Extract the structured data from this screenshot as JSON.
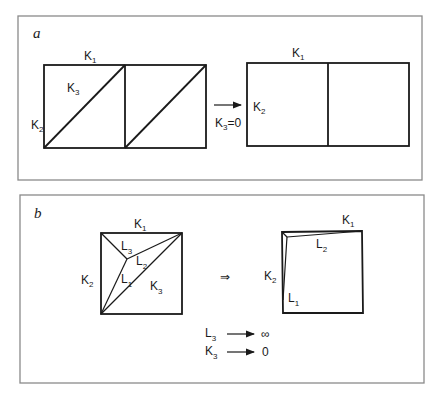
{
  "figure": {
    "panel_a": {
      "letter": "a",
      "before": {
        "labels": {
          "top": "K",
          "top_sub": "1",
          "left": "K",
          "left_sub": "2",
          "diag": "K",
          "diag_sub": "3"
        }
      },
      "transition": {
        "arrow": "→",
        "condition": "K",
        "condition_sub": "3",
        "condition_rest": "=0"
      },
      "after": {
        "labels": {
          "top": "K",
          "top_sub": "1",
          "left": "K",
          "left_sub": "2"
        }
      }
    },
    "panel_b": {
      "letter": "b",
      "before": {
        "labels": {
          "top": "K",
          "top_sub": "1",
          "left": "K",
          "left_sub": "2",
          "l3": "L",
          "l3_sub": "3",
          "l2": "L",
          "l2_sub": "2",
          "l1": "L",
          "l1_sub": "1",
          "k3": "K",
          "k3_sub": "3"
        }
      },
      "implies": "⇒",
      "after": {
        "labels": {
          "top": "K",
          "top_sub": "1",
          "left": "K",
          "left_sub": "2",
          "l2": "L",
          "l2_sub": "2",
          "l1": "L",
          "l1_sub": "1"
        }
      },
      "limits": [
        {
          "var": "L",
          "sub": "3",
          "value": "∞"
        },
        {
          "var": "K",
          "sub": "3",
          "value": "0"
        }
      ]
    }
  }
}
